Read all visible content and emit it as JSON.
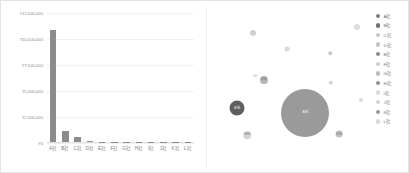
{
  "chart_data": [
    {
      "type": "bar",
      "title": "",
      "xlabel": "",
      "ylabel": "",
      "categories": [
        "A社",
        "B社",
        "C社",
        "D社",
        "E社",
        "F社",
        "G社",
        "H社",
        "I社",
        "J社",
        "K社",
        "L社"
      ],
      "values": [
        10900000,
        1080000,
        520000,
        95000,
        38000,
        26000,
        20000,
        16000,
        12000,
        9000,
        7000,
        5000
      ],
      "ylim": [
        0,
        12500000
      ],
      "yticks": [
        0,
        2500000,
        5000000,
        7500000,
        10000000,
        12500000
      ],
      "ytick_labels": [
        "¥0",
        "¥2,500,000",
        "¥5,000,000",
        "¥7,500,000",
        "¥10,000,000",
        "¥12,500,000"
      ],
      "grid": true,
      "legend": "none",
      "bar_color": "#8c8c8c"
    },
    {
      "type": "scatter",
      "title": "",
      "xlabel": "",
      "ylabel": "",
      "grid": false,
      "legend": "right",
      "points": [
        {
          "name": "A社",
          "x": 61.5,
          "y": 67.0,
          "size": 48.0,
          "color": "#9a9a9a",
          "label": "A社"
        },
        {
          "name": "B社",
          "x": 15.5,
          "y": 64.0,
          "size": 15.0,
          "color": "#5e5e5e",
          "label": "B社"
        },
        {
          "name": "C社",
          "x": 33.5,
          "y": 45.5,
          "size": 8.0,
          "color": "#b5b5b5",
          "label": "C社"
        },
        {
          "name": "D社",
          "x": 84.5,
          "y": 80.5,
          "size": 7.0,
          "color": "#c2c2c2",
          "label": "D社"
        },
        {
          "name": "E社",
          "x": 22.5,
          "y": 81.5,
          "size": 7.5,
          "color": "#d6d6d6",
          "label": "E社"
        },
        {
          "name": "F社",
          "x": 26.5,
          "y": 15.5,
          "size": 6.0,
          "color": "#d2d2d2",
          "label": "F社"
        },
        {
          "name": "G社",
          "x": 96.5,
          "y": 11.5,
          "size": 6.0,
          "color": "#dcdcdc",
          "label": "G社"
        },
        {
          "name": "H社",
          "x": 49.5,
          "y": 26.0,
          "size": 5.0,
          "color": "#d9d9d9",
          "label": "H社"
        },
        {
          "name": "I社",
          "x": 79.0,
          "y": 47.5,
          "size": 4.5,
          "color": "#d4d4d4",
          "label": "I社"
        },
        {
          "name": "J社",
          "x": 78.5,
          "y": 28.5,
          "size": 3.5,
          "color": "#c9c9c9",
          "label": "J社"
        },
        {
          "name": "K社",
          "x": 28.0,
          "y": 43.0,
          "size": 3.5,
          "color": "#dddddd",
          "label": "K社"
        },
        {
          "name": "L社",
          "x": 99.5,
          "y": 58.5,
          "size": 4.0,
          "color": "#dbdbdb",
          "label": "L社"
        }
      ],
      "legend_entries": [
        {
          "label": "A社",
          "color": "#7d7d7d"
        },
        {
          "label": "B社",
          "color": "#707070"
        },
        {
          "label": "C社",
          "color": "#c8c8c8"
        },
        {
          "label": "D社",
          "color": "#c4c4c4"
        },
        {
          "label": "E社",
          "color": "#8a8a8a"
        },
        {
          "label": "F社",
          "color": "#cfcfcf"
        },
        {
          "label": "G社",
          "color": "#bdbdbd"
        },
        {
          "label": "H社",
          "color": "#8f8f8f"
        },
        {
          "label": "I社",
          "color": "#dcdcdc"
        },
        {
          "label": "J社",
          "color": "#d2d2d2"
        },
        {
          "label": "K社",
          "color": "#989898"
        },
        {
          "label": "L社",
          "color": "#dadada"
        }
      ]
    }
  ]
}
